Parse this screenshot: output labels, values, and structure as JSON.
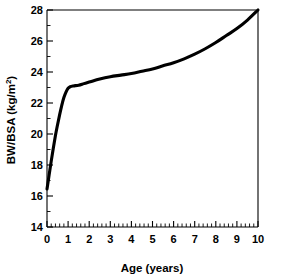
{
  "figure": {
    "background_color": "#ffffff",
    "curve_color": "#000000",
    "axis_color": "#000000"
  },
  "chart_data": {
    "type": "line",
    "title": "",
    "subtitle": "",
    "xlabel": "Age (years)",
    "ylabel": "BW/BSA (kg/m²)",
    "ylabel_base": "BW/BSA (kg/m",
    "ylabel_superscript": "2",
    "ylabel_close": ")",
    "xlim": [
      0,
      10
    ],
    "ylim": [
      14,
      28
    ],
    "xticks": [
      0,
      1,
      2,
      3,
      4,
      5,
      6,
      7,
      8,
      9,
      10
    ],
    "xtick_labels": [
      "0",
      "1",
      "2",
      "3",
      "4",
      "5",
      "6",
      "7",
      "8",
      "9",
      "10"
    ],
    "yticks": [
      14,
      16,
      18,
      20,
      22,
      24,
      26,
      28
    ],
    "ytick_labels": [
      "14",
      "16",
      "18",
      "20",
      "22",
      "24",
      "26",
      "28"
    ],
    "x_minor_ticks_per_interval": 5,
    "y_minor_ticks_per_interval": 2,
    "grid": false,
    "legend": false,
    "legend_position": "none",
    "annotations": [],
    "series": [
      {
        "name": "BW/BSA",
        "x": [
          0.0,
          0.1,
          0.2,
          0.3,
          0.4,
          0.5,
          0.6,
          0.7,
          0.8,
          0.9,
          1.0,
          1.1,
          1.25,
          1.5,
          1.75,
          2.0,
          2.5,
          3.0,
          3.5,
          4.0,
          4.5,
          5.0,
          5.5,
          6.0,
          6.5,
          7.0,
          7.5,
          8.0,
          8.5,
          9.0,
          9.5,
          10.0
        ],
        "y": [
          16.45,
          17.35,
          18.25,
          19.1,
          19.9,
          20.6,
          21.25,
          21.85,
          22.35,
          22.7,
          22.95,
          23.05,
          23.1,
          23.15,
          23.25,
          23.35,
          23.55,
          23.7,
          23.8,
          23.9,
          24.05,
          24.2,
          24.4,
          24.6,
          24.85,
          25.15,
          25.5,
          25.9,
          26.35,
          26.8,
          27.35,
          28.0
        ]
      }
    ]
  }
}
